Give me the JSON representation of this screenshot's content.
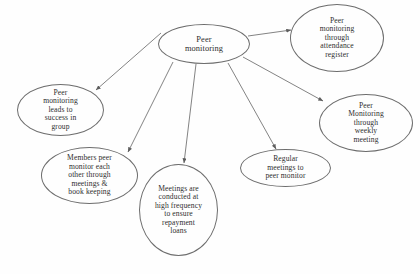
{
  "diagram": {
    "type": "concept-map",
    "layout": "radial hub-and-spoke",
    "background_color": "#fefefe",
    "stroke_color": "#6d6d6d",
    "text_color": "#2e2e2e",
    "center_node": {
      "id": "peer-monitoring",
      "label": "Peer\nmonitoring"
    },
    "nodes": [
      {
        "id": "attendance-register",
        "label": "Peer\nmonitoring\nthrough\nattendance\nregister",
        "shape": "ellipse"
      },
      {
        "id": "weekly-meeting",
        "label": "Peer\nMonitoring\nthrough\nweekly\nmeeting",
        "shape": "ellipse"
      },
      {
        "id": "regular-meetings",
        "label": "Regular\nmeetings to\npeer monitor",
        "shape": "ellipse"
      },
      {
        "id": "high-frequency-meetings",
        "label": "Meetings are\nconducted at\nhigh frequency\nto ensure\nrepayment\nloans",
        "shape": "circle"
      },
      {
        "id": "members-peer-monitor",
        "label": "Members peer\nmonitor each\nother through\nmeetings &\nbook keeping",
        "shape": "ellipse"
      },
      {
        "id": "success-in-group",
        "label": "Peer\nmonitoring\nleads to\nsuccess in\ngroup",
        "shape": "ellipse"
      }
    ],
    "edges": [
      {
        "from": "peer-monitoring",
        "to": "attendance-register",
        "arrow": "to"
      },
      {
        "from": "peer-monitoring",
        "to": "weekly-meeting",
        "arrow": "to"
      },
      {
        "from": "peer-monitoring",
        "to": "regular-meetings",
        "arrow": "to"
      },
      {
        "from": "peer-monitoring",
        "to": "high-frequency-meetings",
        "arrow": "to"
      },
      {
        "from": "peer-monitoring",
        "to": "members-peer-monitor",
        "arrow": "to"
      },
      {
        "from": "peer-monitoring",
        "to": "success-in-group",
        "arrow": "to"
      }
    ]
  }
}
